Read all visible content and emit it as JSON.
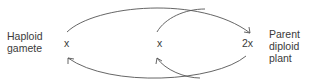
{
  "diagram": {
    "left_label": {
      "line1": "Haploid",
      "line2": "gamete"
    },
    "right_label": {
      "line1": "Parent",
      "line2": "diploid",
      "line3": "plant"
    },
    "nodes": {
      "left": "x",
      "middle": "x",
      "right": "2x"
    },
    "arrows": [
      {
        "from": "left x",
        "to": "2x",
        "path": "upper outer arc"
      },
      {
        "from": "middle x",
        "to": "2x",
        "path": "upper inner arc (joins outer)"
      },
      {
        "from": "2x",
        "to": "left x",
        "path": "lower outer arc"
      },
      {
        "from": "2x",
        "to": "middle x",
        "path": "lower inner arc (branches from outer)"
      }
    ],
    "stroke_color": "#555555"
  }
}
